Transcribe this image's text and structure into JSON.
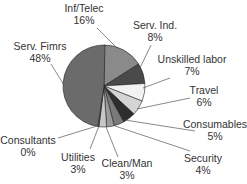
{
  "chart_data": {
    "type": "pie",
    "title": "",
    "categories": [
      "Inf/Telec",
      "Serv. Ind.",
      "Unskilled labor",
      "Travel",
      "Consumables",
      "Security",
      "Clean/Man",
      "Utilities",
      "Consultants",
      "Serv. Fimrs"
    ],
    "values": [
      16,
      8,
      7,
      6,
      5,
      4,
      3,
      3,
      0,
      48
    ],
    "value_labels": [
      "16%",
      "8%",
      "7%",
      "6%",
      "5%",
      "4%",
      "3%",
      "3%",
      "0%",
      "48%"
    ],
    "colors": [
      "#8a8a8a",
      "#4a4a4a",
      "#f2f2f2",
      "#d4d4d4",
      "#2e2e2e",
      "#7a7a7a",
      "#9a9a9a",
      "#c8c8c8",
      "#5a5a5a",
      "#6b6b6b"
    ],
    "start_angle_deg": 0,
    "direction": "clockwise",
    "legend": "none (callout labels)"
  },
  "labels": [
    {
      "name": "Inf/Telec",
      "pct": "16%",
      "x": 84,
      "y": 2,
      "lx": 117,
      "ly": 48,
      "tx": 97,
      "ty": 28
    },
    {
      "name": "Serv. Ind.",
      "pct": "8%",
      "x": 155,
      "y": 19,
      "lx": 139,
      "ly": 70,
      "tx": 151,
      "ty": 45
    },
    {
      "name": "Unskilled labor",
      "pct": "7%",
      "x": 192,
      "y": 53,
      "lx": 143,
      "ly": 88,
      "tx": 170,
      "ty": 78
    },
    {
      "name": "Travel",
      "pct": "6%",
      "x": 204,
      "y": 84,
      "lx": 137,
      "ly": 109,
      "tx": 190,
      "ty": 98
    },
    {
      "name": "Consumables",
      "pct": "5%",
      "x": 215,
      "y": 118,
      "lx": 125,
      "ly": 120,
      "tx": 195,
      "ty": 131
    },
    {
      "name": "Security",
      "pct": "4%",
      "x": 203,
      "y": 152,
      "lx": 115,
      "ly": 126,
      "tx": 190,
      "ty": 151
    },
    {
      "name": "Clean/Man",
      "pct": "3%",
      "x": 127,
      "y": 157,
      "lx": 106,
      "ly": 127,
      "tx": 118,
      "ty": 157
    },
    {
      "name": "Utilities",
      "pct": "3%",
      "x": 78,
      "y": 151,
      "lx": 99,
      "ly": 126,
      "tx": 90,
      "ty": 149
    },
    {
      "name": "Consultants",
      "pct": "0%",
      "x": 28,
      "y": 134,
      "lx": 97,
      "ly": 126,
      "tx": 58,
      "ty": 138
    },
    {
      "name": "Serv. Fimrs",
      "pct": "48%",
      "x": 40,
      "y": 40,
      "lx": 64,
      "ly": 85,
      "tx": 51,
      "ty": 64
    }
  ]
}
